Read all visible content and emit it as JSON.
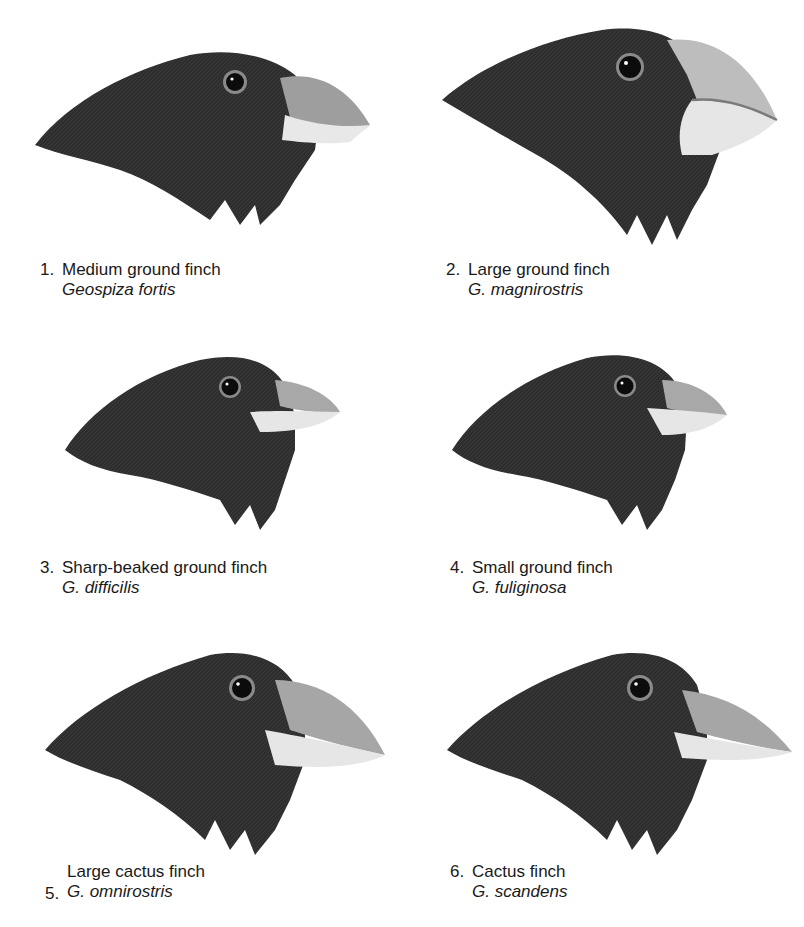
{
  "figure": {
    "type": "illustration-grid",
    "colors": {
      "background": "#ffffff",
      "plumage": "#2b2b2b",
      "beak_light": "#e6e6e6",
      "beak_shade": "#a9a9a9",
      "eye_ring": "#8c8c8c",
      "text": "#1a1a1a"
    },
    "finches": [
      {
        "number": "1.",
        "common_name": "Medium ground finch",
        "scientific_name": "Geospiza fortis"
      },
      {
        "number": "2.",
        "common_name": "Large ground finch",
        "scientific_name": "G. magnirostris"
      },
      {
        "number": "3.",
        "common_name": "Sharp-beaked ground finch",
        "scientific_name": "G. difficilis"
      },
      {
        "number": "4.",
        "common_name": "Small ground finch",
        "scientific_name": "G. fuliginosa"
      },
      {
        "number": "5.",
        "common_name": "Large cactus finch",
        "scientific_name": "G. omnirostris"
      },
      {
        "number": "6.",
        "common_name": "Cactus finch",
        "scientific_name": "G. scandens"
      }
    ]
  }
}
